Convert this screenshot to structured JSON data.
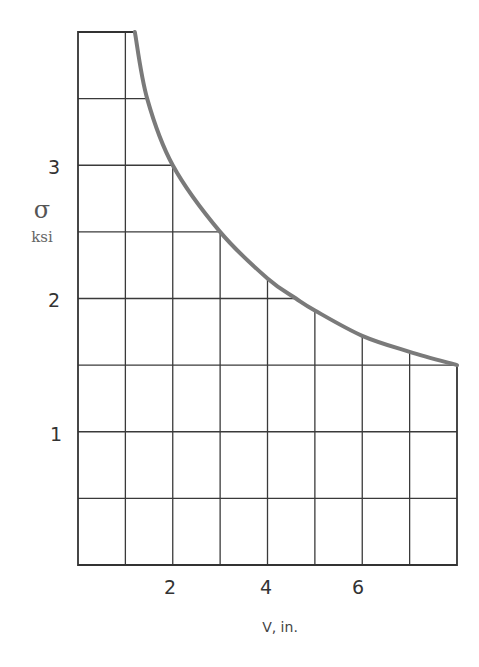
{
  "chart_data": {
    "type": "line",
    "title": "",
    "xlabel": "V, in.",
    "ylabel": "σ",
    "ylabel_unit": "ksi",
    "xlim": [
      0,
      8
    ],
    "ylim": [
      0,
      4
    ],
    "x_ticks": [
      2,
      4,
      6
    ],
    "x_tick_labels": [
      "2",
      "4",
      "6"
    ],
    "y_ticks": [
      1,
      2,
      3
    ],
    "y_tick_labels": [
      "1",
      "2",
      "3"
    ],
    "grid": true,
    "grid_x_step": 1,
    "grid_y_step": 0.5,
    "legend": null,
    "series": [
      {
        "name": "sigma vs V",
        "color": "#7a7a7a",
        "x": [
          1.2,
          1.46,
          2.0,
          3.0,
          4.0,
          4.6,
          5.0,
          6.0,
          7.0,
          8.0
        ],
        "y": [
          4.0,
          3.5,
          3.0,
          2.5,
          2.15,
          2.0,
          1.91,
          1.72,
          1.6,
          1.5
        ]
      }
    ],
    "top_segment": {
      "x": [
        0,
        1.2
      ],
      "y": [
        4.0,
        4.0
      ]
    }
  },
  "labels": {
    "y_symbol": "σ",
    "y_unit": "ksi",
    "x_label": "V, in.",
    "y_tick_1": "1",
    "y_tick_2": "2",
    "y_tick_3": "3",
    "x_tick_2": "2",
    "x_tick_4": "4",
    "x_tick_6": "6"
  }
}
